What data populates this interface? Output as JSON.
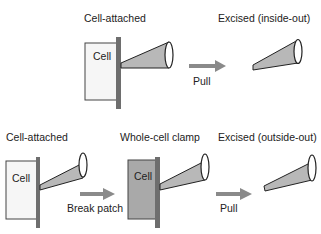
{
  "colors": {
    "cell_light": "#f6f6f6",
    "cell_gray": "#a9a9a9",
    "membrane": "#6e6e6e",
    "pipette_fill": "#b8b8b8",
    "arrow": "#8a8a8a",
    "outline": "#333333",
    "text": "#222222"
  },
  "top_row": {
    "stage1": {
      "title": "Cell-attached",
      "cell_label": "Cell"
    },
    "arrow": {
      "label": "Pull"
    },
    "stage2": {
      "title": "Excised (inside-out)"
    }
  },
  "bottom_row": {
    "stage1": {
      "title": "Cell-attached",
      "cell_label": "Cell"
    },
    "arrow1": {
      "label": "Break patch"
    },
    "stage2": {
      "title": "Whole-cell clamp",
      "cell_label": "Cell"
    },
    "arrow2": {
      "label": "Pull"
    },
    "stage3": {
      "title": "Excised (outside-out)"
    }
  }
}
